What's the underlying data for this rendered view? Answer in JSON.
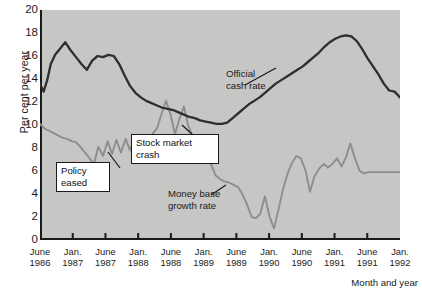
{
  "chart_data": {
    "type": "line",
    "title": "",
    "xlabel": "Month and year",
    "ylabel": "Per cent per year",
    "ylim": [
      0,
      20
    ],
    "ytick_step": 2,
    "yminor_step": 1,
    "grid": false,
    "legend": "inline-annotations",
    "yticks": [
      "0",
      "2",
      "4",
      "6",
      "8",
      "10",
      "12",
      "14",
      "16",
      "18",
      "20"
    ],
    "xticks": [
      {
        "month": "June",
        "year": "1986"
      },
      {
        "month": "Jan.",
        "year": "1987"
      },
      {
        "month": "June",
        "year": "1987"
      },
      {
        "month": "Jan.",
        "year": "1988"
      },
      {
        "month": "June",
        "year": "1988"
      },
      {
        "month": "Jan.",
        "year": "1989"
      },
      {
        "month": "June",
        "year": "1989"
      },
      {
        "month": "Jan.",
        "year": "1990"
      },
      {
        "month": "June",
        "year": "1990"
      },
      {
        "month": "Jan.",
        "year": "1991"
      },
      {
        "month": "June",
        "year": "1991"
      },
      {
        "month": "Jan.",
        "year": "1992"
      }
    ],
    "series": [
      {
        "name": "Official cash rate",
        "color": "#2e2e2e",
        "x": [
          0.0,
          0.1,
          0.2,
          0.3,
          0.42,
          0.55,
          0.7,
          0.85,
          1.0,
          1.15,
          1.3,
          1.45,
          1.6,
          1.75,
          1.9,
          2.05,
          2.2,
          2.35,
          2.5,
          2.65,
          2.8,
          2.95,
          3.1,
          3.25,
          3.4,
          3.55,
          3.7,
          3.85,
          4.0,
          4.15,
          4.3,
          4.45,
          4.6,
          4.75,
          4.9,
          5.05,
          5.2,
          5.35,
          5.5,
          5.65,
          5.8,
          5.95,
          6.1,
          6.25,
          6.4,
          6.55,
          6.7,
          6.85,
          7.0,
          7.15,
          7.3,
          7.45,
          7.6,
          7.75,
          7.9,
          8.05,
          8.2,
          8.35,
          8.5,
          8.65,
          8.8,
          8.95,
          9.1,
          9.25,
          9.4,
          9.55,
          9.7,
          9.85,
          10.0
        ],
        "values": [
          13.6,
          12.9,
          13.9,
          15.3,
          16.1,
          16.6,
          17.2,
          16.5,
          15.9,
          15.3,
          14.8,
          15.6,
          16.0,
          15.9,
          16.1,
          16.0,
          15.3,
          14.3,
          13.4,
          12.8,
          12.4,
          12.1,
          11.9,
          11.7,
          11.5,
          11.4,
          11.3,
          11.1,
          10.9,
          10.7,
          10.6,
          10.4,
          10.3,
          10.2,
          10.1,
          10.1,
          10.2,
          10.6,
          11.0,
          11.4,
          11.8,
          12.1,
          12.4,
          12.8,
          13.2,
          13.6,
          13.9,
          14.2,
          14.5,
          14.8,
          15.1,
          15.5,
          15.9,
          16.3,
          16.8,
          17.2,
          17.5,
          17.7,
          17.8,
          17.7,
          17.3,
          16.6,
          15.8,
          15.1,
          14.4,
          13.6,
          13.0,
          12.9,
          12.4
        ]
      },
      {
        "name": "Money base growth rate",
        "color": "#8e8e8e",
        "x": [
          0.0,
          0.12,
          0.25,
          0.38,
          0.5,
          0.62,
          0.75,
          0.88,
          1.0,
          1.12,
          1.25,
          1.38,
          1.5,
          1.62,
          1.75,
          1.88,
          2.0,
          2.12,
          2.25,
          2.38,
          2.5,
          2.62,
          2.75,
          2.88,
          3.0,
          3.12,
          3.25,
          3.38,
          3.5,
          3.62,
          3.75,
          3.88,
          4.0,
          4.12,
          4.25,
          4.38,
          4.5,
          4.62,
          4.75,
          4.88,
          5.0,
          5.12,
          5.25,
          5.38,
          5.5,
          5.62,
          5.75,
          5.88,
          6.0,
          6.12,
          6.25,
          6.38,
          6.5,
          6.62,
          6.75,
          6.88,
          7.0,
          7.12,
          7.25,
          7.38,
          7.5,
          7.62,
          7.75,
          7.88,
          8.0,
          8.12,
          8.25,
          8.38,
          8.5,
          8.62,
          8.75,
          8.88,
          9.0,
          9.12,
          9.25,
          9.38,
          9.5,
          9.62,
          9.75,
          9.88,
          10.0
        ],
        "values": [
          10.1,
          9.7,
          9.5,
          9.3,
          9.1,
          8.9,
          8.8,
          8.6,
          8.5,
          8.1,
          7.6,
          7.1,
          6.6,
          8.1,
          7.3,
          8.6,
          7.5,
          8.7,
          7.6,
          8.8,
          7.8,
          8.9,
          8.1,
          9.0,
          8.5,
          9.2,
          9.7,
          11.0,
          12.1,
          11.0,
          9.2,
          10.6,
          11.6,
          9.9,
          8.9,
          8.5,
          8.2,
          7.4,
          6.6,
          5.6,
          5.3,
          5.1,
          5.0,
          4.8,
          4.6,
          4.0,
          3.1,
          2.0,
          1.9,
          2.3,
          3.8,
          2.0,
          1.0,
          2.6,
          4.4,
          5.8,
          6.7,
          7.3,
          7.1,
          6.0,
          4.2,
          5.5,
          6.2,
          6.6,
          6.3,
          6.6,
          7.1,
          6.4,
          7.2,
          8.4,
          7.1,
          6.0,
          5.8,
          5.9,
          5.9,
          5.9,
          5.9,
          5.9,
          5.9,
          5.9,
          5.9
        ]
      }
    ],
    "annotations": [
      {
        "id": "policy-eased",
        "text": "Policy\neased",
        "boxed": true
      },
      {
        "id": "stock-market-crash",
        "text": "Stock market\ncrash",
        "boxed": true
      },
      {
        "id": "official-cash-rate",
        "text": "Official\ncash rate",
        "boxed": false
      },
      {
        "id": "money-base-growth",
        "text": "Money base\ngrowth rate",
        "boxed": false
      }
    ]
  },
  "colors": {
    "plot_background": "#c6c6c4",
    "axis": "#1a1a1a",
    "cash_rate_line": "#2e2e2e",
    "money_base_line": "#8e8e8e",
    "page_background": "#ffffff"
  }
}
